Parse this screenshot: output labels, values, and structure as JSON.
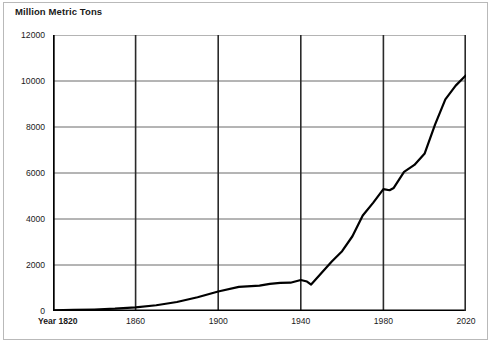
{
  "chart_title": "Million Metric Tons",
  "axes": {
    "y_ticks": [
      "0",
      "2000",
      "4000",
      "6000",
      "8000",
      "10000",
      "12000"
    ],
    "x_ticks": [
      "Year 1820",
      "1860",
      "1900",
      "1940",
      "1980",
      "2020"
    ]
  },
  "colors": {
    "line": "#000000",
    "gridline": "#6b6b6b",
    "axis": "#000000",
    "border": "#b9b9b9",
    "background": "#ffffff",
    "text": "#1a1a1a"
  },
  "chart_data": {
    "type": "line",
    "title": "Million Metric Tons",
    "xlabel": "Year",
    "ylabel": "Million Metric Tons",
    "xlim": [
      1820,
      2020
    ],
    "ylim": [
      0,
      12000
    ],
    "grid": true,
    "legend": null,
    "xticks": [
      1820,
      1860,
      1900,
      1940,
      1980,
      2020
    ],
    "xticklabels": [
      "Year 1820",
      "1860",
      "1900",
      "1940",
      "1980",
      "2020"
    ],
    "yticks": [
      0,
      2000,
      4000,
      6000,
      8000,
      10000,
      12000
    ],
    "yticklabels": [
      "0",
      "2000",
      "4000",
      "6000",
      "8000",
      "10000",
      "12000"
    ],
    "series": [
      {
        "name": "Million Metric Tons",
        "x": [
          1820,
          1830,
          1840,
          1850,
          1860,
          1870,
          1880,
          1890,
          1900,
          1910,
          1920,
          1925,
          1930,
          1935,
          1940,
          1943,
          1945,
          1950,
          1955,
          1960,
          1965,
          1970,
          1975,
          1980,
          1983,
          1985,
          1990,
          1995,
          2000,
          2005,
          2010,
          2015,
          2020
        ],
        "y": [
          30,
          45,
          65,
          100,
          160,
          250,
          390,
          600,
          850,
          1050,
          1100,
          1180,
          1220,
          1230,
          1350,
          1280,
          1150,
          1650,
          2150,
          2600,
          3250,
          4150,
          4700,
          5300,
          5250,
          5350,
          6050,
          6350,
          6850,
          8100,
          9200,
          9800,
          10250
        ]
      }
    ]
  }
}
